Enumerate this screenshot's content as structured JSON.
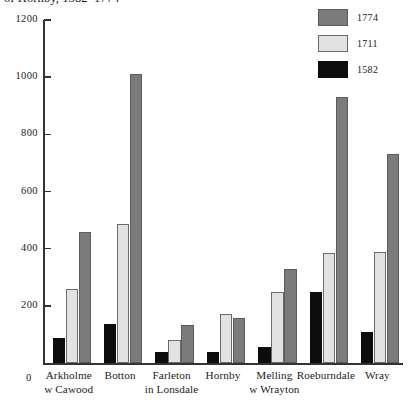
{
  "chart_data": {
    "type": "bar",
    "title": "of Hornby, 1582–1774",
    "xlabel": "",
    "ylabel": "",
    "ylim": [
      0,
      1200
    ],
    "ytick_step": 200,
    "yticks": [
      200,
      400,
      600,
      800,
      1000,
      1200
    ],
    "ytick_labels": [
      "200",
      "400",
      "600",
      "800",
      "1000",
      "1200"
    ],
    "grid": false,
    "legend_position": "top-right",
    "zero_label": "0",
    "categories": [
      "Arkholme\nw Cawood",
      "Botton",
      "Farleton\nin Lonsdale",
      "Hornby",
      "Melling\nw Wrayton",
      "Roeburndale",
      "Wray"
    ],
    "category_lines": [
      [
        "Arkholme",
        "w Cawood"
      ],
      [
        "Botton",
        ""
      ],
      [
        "Farleton",
        "in Lonsdale"
      ],
      [
        "Hornby",
        ""
      ],
      [
        "Melling",
        "w Wrayton"
      ],
      [
        "Roeburndale",
        ""
      ],
      [
        "Wray",
        ""
      ]
    ],
    "series": [
      {
        "name": "1582",
        "color": "#0d0d0d",
        "values": [
          88,
          138,
          38,
          40,
          55,
          248,
          110
        ]
      },
      {
        "name": "1711",
        "color": "#e2e2e0",
        "values": [
          258,
          485,
          80,
          173,
          248,
          385,
          390
        ]
      },
      {
        "name": "1774",
        "color": "#7b7b7b",
        "values": [
          460,
          1010,
          133,
          158,
          328,
          930,
          730
        ]
      }
    ]
  },
  "legend": {
    "items": [
      {
        "label": "1774",
        "color": "#7b7b7b"
      },
      {
        "label": "1711",
        "color": "#e2e2e0"
      },
      {
        "label": "1582",
        "color": "#0d0d0d"
      }
    ]
  }
}
